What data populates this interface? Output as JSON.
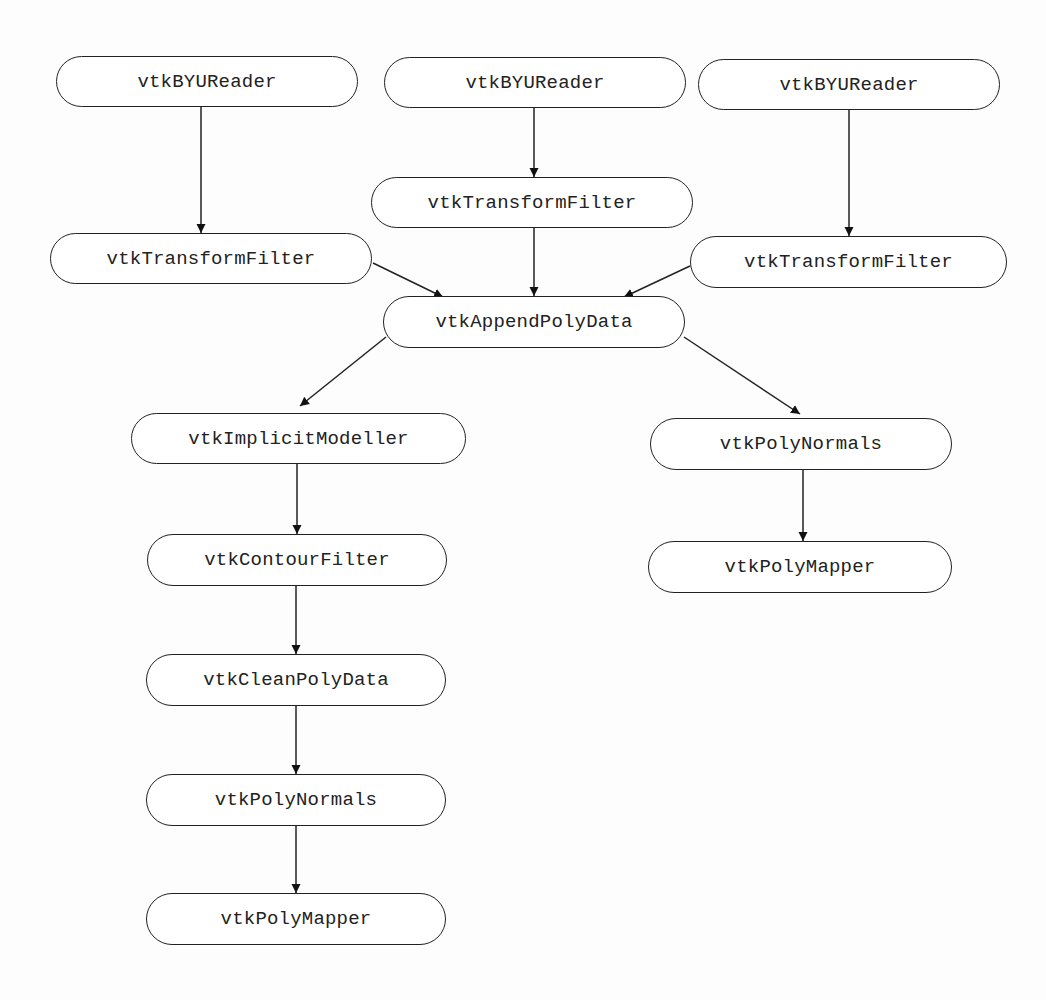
{
  "diagram": {
    "type": "pipeline-flowchart",
    "nodes": [
      {
        "id": "reader1",
        "label": "vtkBYUReader",
        "x": 56,
        "y": 56,
        "w": 302,
        "h": 51
      },
      {
        "id": "reader2",
        "label": "vtkBYUReader",
        "x": 384,
        "y": 57,
        "w": 302,
        "h": 51
      },
      {
        "id": "reader3",
        "label": "vtkBYUReader",
        "x": 698,
        "y": 59,
        "w": 302,
        "h": 51
      },
      {
        "id": "transform2",
        "label": "vtkTransformFilter",
        "x": 371,
        "y": 177,
        "w": 322,
        "h": 51
      },
      {
        "id": "transform1",
        "label": "vtkTransformFilter",
        "x": 50,
        "y": 233,
        "w": 322,
        "h": 51
      },
      {
        "id": "transform3",
        "label": "vtkTransformFilter",
        "x": 690,
        "y": 236,
        "w": 317,
        "h": 52
      },
      {
        "id": "append",
        "label": "vtkAppendPolyData",
        "x": 383,
        "y": 296,
        "w": 302,
        "h": 52
      },
      {
        "id": "implicit",
        "label": "vtkImplicitModeller",
        "x": 131,
        "y": 413,
        "w": 335,
        "h": 51
      },
      {
        "id": "contour",
        "label": "vtkContourFilter",
        "x": 147,
        "y": 534,
        "w": 300,
        "h": 52
      },
      {
        "id": "clean",
        "label": "vtkCleanPolyData",
        "x": 146,
        "y": 654,
        "w": 300,
        "h": 52
      },
      {
        "id": "normalsL",
        "label": "vtkPolyNormals",
        "x": 146,
        "y": 774,
        "w": 300,
        "h": 52
      },
      {
        "id": "mapperL",
        "label": "vtkPolyMapper",
        "x": 146,
        "y": 893,
        "w": 300,
        "h": 52
      },
      {
        "id": "normalsR",
        "label": "vtkPolyNormals",
        "x": 650,
        "y": 418,
        "w": 302,
        "h": 52
      },
      {
        "id": "mapperR",
        "label": "vtkPolyMapper",
        "x": 648,
        "y": 541,
        "w": 304,
        "h": 52
      }
    ],
    "edges": [
      {
        "from": "reader1",
        "to": "transform1",
        "x1": 201,
        "y1": 107,
        "x2": 201,
        "y2": 233
      },
      {
        "from": "reader2",
        "to": "transform2",
        "x1": 534,
        "y1": 108,
        "x2": 534,
        "y2": 177
      },
      {
        "from": "reader3",
        "to": "transform3",
        "x1": 849,
        "y1": 110,
        "x2": 849,
        "y2": 236
      },
      {
        "from": "transform1",
        "to": "append",
        "x1": 373,
        "y1": 263,
        "x2": 443,
        "y2": 297
      },
      {
        "from": "transform2",
        "to": "append",
        "x1": 534,
        "y1": 228,
        "x2": 534,
        "y2": 296
      },
      {
        "from": "transform3",
        "to": "append",
        "x1": 690,
        "y1": 266,
        "x2": 624,
        "y2": 297
      },
      {
        "from": "append",
        "to": "implicit",
        "x1": 386,
        "y1": 337,
        "x2": 300,
        "y2": 406
      },
      {
        "from": "append",
        "to": "normalsR",
        "x1": 684,
        "y1": 337,
        "x2": 800,
        "y2": 414
      },
      {
        "from": "implicit",
        "to": "contour",
        "x1": 297,
        "y1": 464,
        "x2": 297,
        "y2": 534
      },
      {
        "from": "contour",
        "to": "clean",
        "x1": 296,
        "y1": 586,
        "x2": 296,
        "y2": 654
      },
      {
        "from": "clean",
        "to": "normalsL",
        "x1": 296,
        "y1": 706,
        "x2": 296,
        "y2": 774
      },
      {
        "from": "normalsL",
        "to": "mapperL",
        "x1": 296,
        "y1": 826,
        "x2": 296,
        "y2": 893
      },
      {
        "from": "normalsR",
        "to": "mapperR",
        "x1": 803,
        "y1": 470,
        "x2": 803,
        "y2": 541
      }
    ],
    "colors": {
      "stroke": "#222222",
      "fill": "#ffffff",
      "background": "#fdfdfd"
    }
  }
}
